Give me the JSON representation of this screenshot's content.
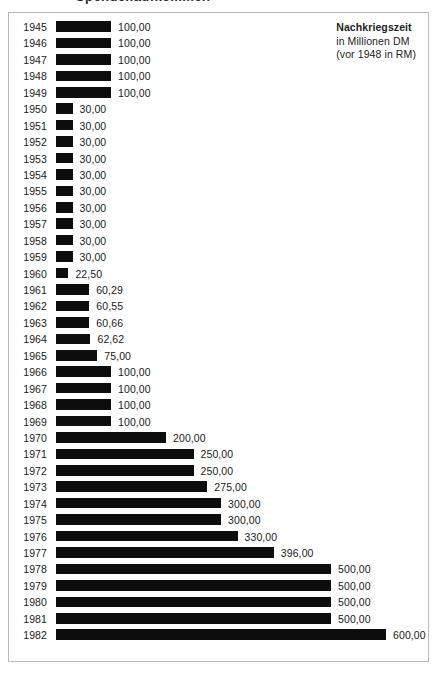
{
  "scan_artifact": {
    "fragment_text": "Spendenaufkommen"
  },
  "legend": {
    "title": "Nachkriegszeit",
    "line2": "in Millionen DM",
    "line3": "(vor 1948 in RM)"
  },
  "chart_data": {
    "type": "bar",
    "orientation": "horizontal",
    "title": "Nachkriegszeit",
    "subtitle": "in Millionen DM (vor 1948 in RM)",
    "xlabel": "",
    "ylabel": "",
    "xlim": [
      0,
      600
    ],
    "grid": false,
    "legend_position": "top-right",
    "value_format": "de-DE, two decimals, comma separator",
    "categories": [
      "1945",
      "1946",
      "1947",
      "1948",
      "1949",
      "1950",
      "1951",
      "1952",
      "1953",
      "1954",
      "1955",
      "1956",
      "1957",
      "1958",
      "1959",
      "1960",
      "1961",
      "1962",
      "1963",
      "1964",
      "1965",
      "1966",
      "1967",
      "1968",
      "1969",
      "1970",
      "1971",
      "1972",
      "1973",
      "1974",
      "1975",
      "1976",
      "1977",
      "1978",
      "1979",
      "1980",
      "1981",
      "1982"
    ],
    "values": [
      100,
      100,
      100,
      100,
      100,
      30,
      30,
      30,
      30,
      30,
      30,
      30,
      30,
      30,
      30,
      22.5,
      60.29,
      60.55,
      60.66,
      62.62,
      75,
      100,
      100,
      100,
      100,
      200,
      250,
      250,
      275,
      300,
      300,
      330,
      396,
      500,
      500,
      500,
      500,
      600
    ],
    "value_labels": [
      "100,00",
      "100,00",
      "100,00",
      "100,00",
      "100,00",
      "30,00",
      "30,00",
      "30,00",
      "30,00",
      "30,00",
      "30,00",
      "30,00",
      "30,00",
      "30,00",
      "30,00",
      "22,50",
      "60,29",
      "60,55",
      "60,66",
      "62,62",
      "75,00",
      "100,00",
      "100,00",
      "100,00",
      "100,00",
      "200,00",
      "250,00",
      "250,00",
      "275,00",
      "300,00",
      "300,00",
      "330,00",
      "396,00",
      "500,00",
      "500,00",
      "500,00",
      "500,00",
      "600,00"
    ],
    "bar_color": "#0d0d0d"
  }
}
